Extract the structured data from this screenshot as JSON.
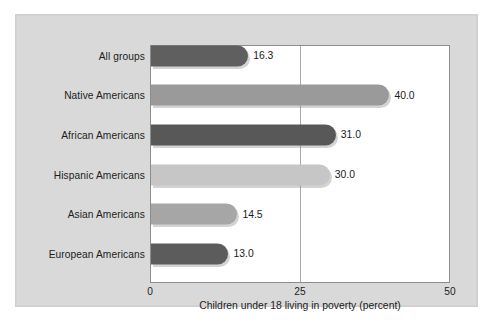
{
  "chart_data": {
    "type": "bar",
    "orientation": "horizontal",
    "title": "",
    "xlabel": "Children under 18 living in poverty (percent)",
    "ylabel": "",
    "xlim": [
      0,
      50
    ],
    "xticks": [
      "0",
      "25",
      "50"
    ],
    "xtick_values": [
      0,
      25,
      50
    ],
    "grid": "vertical gridline at 25",
    "legend": "none",
    "categories": [
      "All groups",
      "Native Americans",
      "African Americans",
      "Hispanic Americans",
      "Asian Americans",
      "European Americans"
    ],
    "values": [
      16.3,
      40.0,
      31.0,
      30.0,
      14.5,
      13.0
    ],
    "value_labels": [
      "16.3",
      "40.0",
      "31.0",
      "30.0",
      "14.5",
      "13.0"
    ],
    "bar_colors": [
      "#5f5f5f",
      "#9a9a9a",
      "#585858",
      "#c6c6c6",
      "#a6a6a6",
      "#5c5c5c"
    ]
  },
  "figure": {
    "panel_background": "#d9d9d9",
    "plot_background": "#ffffff",
    "axis_color": "#8d8d8d",
    "grid_color": "#a9a9a9",
    "text_color": "#1c1c1c"
  }
}
